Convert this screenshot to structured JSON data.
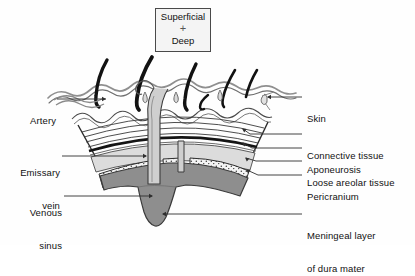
{
  "figure": {
    "orientation_box": {
      "top_label": "Superficial",
      "marker": "+",
      "bottom_label": "Deep"
    },
    "labels_left": [
      {
        "id": "artery",
        "text": "Artery",
        "lines": [
          "Artery"
        ]
      },
      {
        "id": "emissary-vein",
        "text": "Emissary vein",
        "lines": [
          "Emissary",
          "vein"
        ]
      },
      {
        "id": "venous-sinus",
        "text": "Venous sinus",
        "lines": [
          "Venous",
          "sinus"
        ]
      }
    ],
    "labels_right": [
      {
        "id": "skin",
        "text": "Skin",
        "lines": [
          "Skin"
        ]
      },
      {
        "id": "connective-tissue",
        "text": "Connective tissue",
        "lines": [
          "Connective tissue"
        ]
      },
      {
        "id": "aponeurosis",
        "text": "Aponeurosis",
        "lines": [
          "Aponeurosis"
        ]
      },
      {
        "id": "loose-areolar-tissue",
        "text": "Loose areolar tissue",
        "lines": [
          "Loose areolar tissue"
        ]
      },
      {
        "id": "pericranium",
        "text": "Pericranium",
        "lines": [
          "Pericranium"
        ]
      },
      {
        "id": "meningeal-layer",
        "text": "Meningeal layer of dura mater",
        "lines": [
          "Meningeal layer",
          "of dura mater"
        ]
      }
    ],
    "colors": {
      "ink": "#1a1a1a",
      "leader": "#3a3a3a",
      "skin_outline": "#8a8a8a",
      "hair": "#111111",
      "aponeurosis_band": "#161616",
      "loose_areolar_fill": "#d6d6d6",
      "pericranium_fill": "#f2f2f2",
      "dura_fill": "#8c8c8c",
      "dura_outline": "#3d3d3d",
      "vein_fill": "#c9c9c9",
      "box_border": "#4a4a4a",
      "box_fill": "#f4f4f4",
      "background": "#ffffff"
    }
  }
}
